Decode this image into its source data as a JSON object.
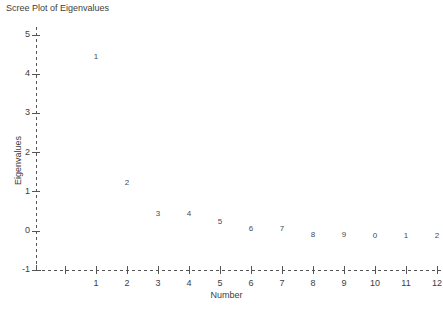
{
  "chart_data": {
    "type": "scatter",
    "title": "Scree Plot of Eigenvalues",
    "xlabel": "Number",
    "ylabel": "Eigenvalues",
    "grid": false,
    "legend": null,
    "xlim": [
      0,
      12.5
    ],
    "ylim": [
      -1,
      5
    ],
    "xticks": [
      "",
      "1",
      "2",
      "3",
      "4",
      "5",
      "6",
      "7",
      "8",
      "9",
      "10",
      "11",
      "12"
    ],
    "xtick_values": [
      0,
      1,
      2,
      3,
      4,
      5,
      6,
      7,
      8,
      9,
      10,
      11,
      12
    ],
    "yticks": [
      "-1",
      "0",
      "1",
      "2",
      "3",
      "4",
      "5"
    ],
    "ytick_values": [
      -1,
      0,
      1,
      2,
      3,
      4,
      5
    ],
    "x": [
      1,
      2,
      3,
      4,
      5,
      6,
      7,
      8,
      9,
      10,
      11,
      12
    ],
    "values": [
      4.44,
      1.23,
      0.44,
      0.44,
      0.23,
      0.05,
      0.05,
      -0.1,
      -0.1,
      -0.13,
      -0.13,
      -0.13
    ],
    "point_labels": [
      "1",
      "2",
      "3",
      "4",
      "5",
      "6",
      "7",
      "8",
      "9",
      "0",
      "1",
      "2"
    ],
    "marker_style": "observation-number",
    "axis_color": "#555555",
    "axis_style": "dashed",
    "text_color": "#3d3d3d",
    "background": "#ffffff"
  },
  "chart": {
    "title": "Scree Plot of Eigenvalues",
    "xlabel": "Number",
    "ylabel": "Eigenvalues"
  }
}
